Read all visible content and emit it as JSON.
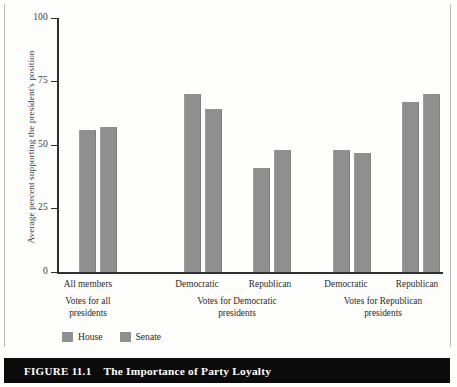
{
  "figure": {
    "caption_number": "FIGURE 11.1",
    "caption_title": "The Importance of Party Loyalty"
  },
  "chart_data": {
    "type": "bar",
    "title": "The Importance of Party Loyalty",
    "xlabel": "",
    "ylabel": "Average percent supporting the president's position",
    "ylim": [
      0,
      100
    ],
    "yticks": [
      0,
      25,
      50,
      75,
      100
    ],
    "ytick_labels": [
      "0",
      "25",
      "50",
      "75",
      "100"
    ],
    "grid": false,
    "legend_position": "bottom-left",
    "categories": [
      "All members",
      "Democratic",
      "Republican",
      "Democratic",
      "Republican"
    ],
    "groups": [
      {
        "label_line1": "Votes for all",
        "label_line2": "presidents",
        "categories": [
          "All members"
        ]
      },
      {
        "label_line1": "Votes for Democratic",
        "label_line2": "presidents",
        "categories": [
          "Democratic",
          "Republican"
        ]
      },
      {
        "label_line1": "Votes for Republican",
        "label_line2": "presidents",
        "categories": [
          "Democratic",
          "Republican"
        ]
      }
    ],
    "series": [
      {
        "name": "House",
        "color": "#8f8f8f",
        "values": [
          56,
          70,
          41,
          48,
          67
        ]
      },
      {
        "name": "Senate",
        "color": "#8f8f8f",
        "values": [
          57,
          64,
          48,
          47,
          70
        ]
      }
    ]
  },
  "legend": {
    "items": [
      {
        "label": "House",
        "color": "#8f8f8f"
      },
      {
        "label": "Senate",
        "color": "#8f8f8f"
      }
    ]
  },
  "axis": {
    "tick_0": "0",
    "tick_25": "25",
    "tick_50": "50",
    "tick_75": "75",
    "tick_100": "100",
    "y_title": "Average percent supporting the president's position"
  },
  "labels": {
    "pair_0": "All members",
    "pair_1": "Democratic",
    "pair_2": "Republican",
    "pair_3": "Democratic",
    "pair_4": "Republican",
    "group_0_line1": "Votes for all",
    "group_0_line2": "presidents",
    "group_1_line1": "Votes for Democratic",
    "group_1_line2": "presidents",
    "group_2_line1": "Votes for Republican",
    "group_2_line2": "presidents"
  }
}
